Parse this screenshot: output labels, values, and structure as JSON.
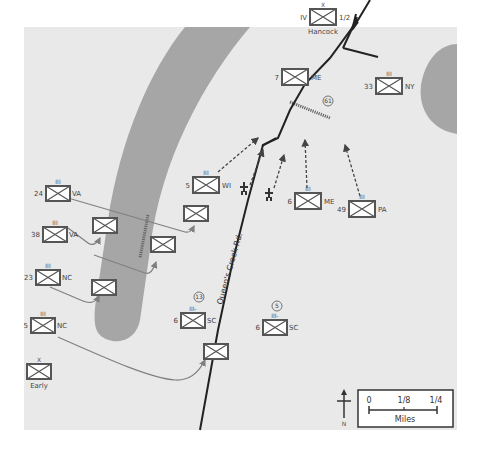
{
  "map": {
    "colors": {
      "background": "#e9e9e9",
      "water": "#a6a6a6",
      "road": "#222222",
      "unit_border": "#555555",
      "arrow": "#808080",
      "dashed_arrow": "#444444"
    },
    "road_label": "Queen's Creek Rd.",
    "route_markers": [
      {
        "id": "61",
        "label": "61"
      },
      {
        "id": "13",
        "label": "13"
      },
      {
        "id": "5",
        "label": "5"
      }
    ],
    "units": [
      {
        "id": "hancock",
        "echelon": "X",
        "left": "IV",
        "right": "1/2",
        "below": "Hancock"
      },
      {
        "id": "7me",
        "echelon": "",
        "left": "7",
        "right": "ME",
        "below": ""
      },
      {
        "id": "33ny",
        "echelon": "III",
        "left": "33",
        "right": "NY",
        "below": ""
      },
      {
        "id": "5wi",
        "echelon": "III",
        "left": "5",
        "right": "WI",
        "below": ""
      },
      {
        "id": "6me",
        "echelon": "III",
        "left": "6",
        "right": "ME",
        "below": ""
      },
      {
        "id": "49pa",
        "echelon": "III",
        "left": "49",
        "right": "PA",
        "below": ""
      },
      {
        "id": "24va",
        "echelon": "III",
        "left": "24",
        "right": "VA",
        "below": ""
      },
      {
        "id": "38va",
        "echelon": "III",
        "left": "38",
        "right": "VA",
        "below": ""
      },
      {
        "id": "23nc",
        "echelon": "III",
        "left": "23",
        "right": "NC",
        "below": ""
      },
      {
        "id": "5nc",
        "echelon": "III",
        "left": "5",
        "right": "NC",
        "below": ""
      },
      {
        "id": "early",
        "echelon": "X",
        "left": "",
        "right": "",
        "below": "Early"
      },
      {
        "id": "6sc_a",
        "echelon": "III-",
        "left": "6",
        "right": "SC",
        "below": ""
      },
      {
        "id": "6sc_b",
        "echelon": "III-",
        "left": "6",
        "right": "SC",
        "below": ""
      },
      {
        "id": "adv1",
        "echelon": "",
        "left": "",
        "right": "",
        "below": ""
      },
      {
        "id": "adv2",
        "echelon": "",
        "left": "",
        "right": "",
        "below": ""
      },
      {
        "id": "adv3",
        "echelon": "",
        "left": "",
        "right": "",
        "below": ""
      },
      {
        "id": "adv4",
        "echelon": "",
        "left": "",
        "right": "",
        "below": ""
      },
      {
        "id": "adv5",
        "echelon": "",
        "left": "",
        "right": "",
        "below": ""
      }
    ],
    "compass": {
      "label": "N"
    },
    "scale": {
      "ticks": [
        "0",
        "1/8",
        "1/4"
      ],
      "unit_label": "Miles"
    }
  }
}
